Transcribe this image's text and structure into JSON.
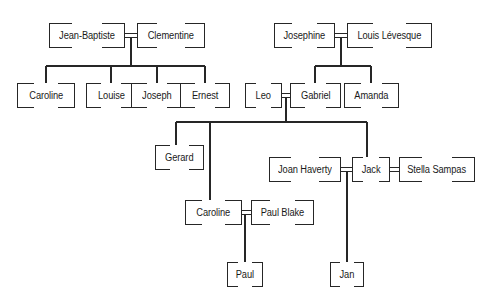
{
  "diagram": {
    "type": "family-tree",
    "background_color": "#ffffff",
    "line_color": "#262626",
    "text_color": "#1a1a1a"
  },
  "nodes": [
    {
      "id": "jean_baptiste",
      "label": "Jean-Baptiste",
      "x": 49,
      "y": 23,
      "w": 76,
      "h": 25,
      "generation": 1
    },
    {
      "id": "clementine",
      "label": "Clementine",
      "x": 137,
      "y": 23,
      "w": 68,
      "h": 25,
      "generation": 1
    },
    {
      "id": "josephine",
      "label": "Josephine",
      "x": 274,
      "y": 23,
      "w": 61,
      "h": 25,
      "generation": 1
    },
    {
      "id": "louis",
      "label": "Louis Lévesque",
      "x": 347,
      "y": 23,
      "w": 85,
      "h": 25,
      "generation": 1
    },
    {
      "id": "caroline1",
      "label": "Caroline",
      "x": 17,
      "y": 83,
      "w": 58,
      "h": 25,
      "generation": 2
    },
    {
      "id": "louise",
      "label": "Louise",
      "x": 86,
      "y": 83,
      "w": 50,
      "h": 25,
      "generation": 2
    },
    {
      "id": "joseph",
      "label": "Joseph",
      "x": 131,
      "y": 83,
      "w": 52,
      "h": 25,
      "generation": 2
    },
    {
      "id": "ernest",
      "label": "Ernest",
      "x": 180,
      "y": 83,
      "w": 50,
      "h": 25,
      "generation": 2
    },
    {
      "id": "leo",
      "label": "Leo",
      "x": 245,
      "y": 83,
      "w": 37,
      "h": 25,
      "generation": 2
    },
    {
      "id": "gabriel",
      "label": "Gabriel",
      "x": 290,
      "y": 83,
      "w": 51,
      "h": 25,
      "generation": 2
    },
    {
      "id": "amanda",
      "label": "Amanda",
      "x": 344,
      "y": 83,
      "w": 55,
      "h": 25,
      "generation": 2
    },
    {
      "id": "gerard",
      "label": "Gerard",
      "x": 155,
      "y": 145,
      "w": 49,
      "h": 25,
      "generation": 3
    },
    {
      "id": "joan_haverty",
      "label": "Joan Haverty",
      "x": 269,
      "y": 157,
      "w": 72,
      "h": 25,
      "generation": 3
    },
    {
      "id": "jack",
      "label": "Jack",
      "x": 352,
      "y": 157,
      "w": 38,
      "h": 25,
      "generation": 3
    },
    {
      "id": "stella",
      "label": "Stella Sampas",
      "x": 399,
      "y": 157,
      "w": 76,
      "h": 25,
      "generation": 3
    },
    {
      "id": "caroline2",
      "label": "Caroline",
      "x": 185,
      "y": 200,
      "w": 57,
      "h": 25,
      "generation": 3
    },
    {
      "id": "paul_blake",
      "label": "Paul Blake",
      "x": 251,
      "y": 200,
      "w": 63,
      "h": 25,
      "generation": 3
    },
    {
      "id": "paul",
      "label": "Paul",
      "x": 227,
      "y": 262,
      "w": 36,
      "h": 25,
      "generation": 4
    },
    {
      "id": "jan",
      "label": "Jan",
      "x": 330,
      "y": 262,
      "w": 34,
      "h": 25,
      "generation": 4
    }
  ],
  "marriages": [
    {
      "a": "jean_baptiste",
      "b": "clementine",
      "children": [
        "caroline1",
        "louise",
        "joseph",
        "ernest"
      ]
    },
    {
      "a": "josephine",
      "b": "louis",
      "children": [
        "gabriel",
        "amanda"
      ]
    },
    {
      "a": "leo",
      "b": "gabriel",
      "children": [
        "gerard",
        "caroline2",
        "jack"
      ]
    },
    {
      "a": "joan_haverty",
      "b": "jack",
      "children": [
        "jan"
      ]
    },
    {
      "a": "jack",
      "b": "stella",
      "children": []
    },
    {
      "a": "caroline2",
      "b": "paul_blake",
      "children": [
        "paul"
      ]
    }
  ],
  "segments": [
    {
      "name": "marriage-jeanbaptiste-clementine-top",
      "x1": 125,
      "y1": 33.5,
      "x2": 137,
      "y2": 33.5
    },
    {
      "name": "marriage-jeanbaptiste-clementine-bot",
      "x1": 125,
      "y1": 37.5,
      "x2": 137,
      "y2": 37.5
    },
    {
      "name": "drop-from-jb-clem",
      "x1": 131,
      "y1": 37.5,
      "x2": 131,
      "y2": 66
    },
    {
      "name": "sibling-bus-gen2-left",
      "x1": 46,
      "y1": 66,
      "x2": 205,
      "y2": 66
    },
    {
      "name": "drop-caroline1",
      "x1": 46,
      "y1": 66,
      "x2": 46,
      "y2": 83
    },
    {
      "name": "drop-louise",
      "x1": 111,
      "y1": 66,
      "x2": 111,
      "y2": 83
    },
    {
      "name": "drop-joseph",
      "x1": 157,
      "y1": 66,
      "x2": 157,
      "y2": 83
    },
    {
      "name": "drop-ernest",
      "x1": 205,
      "y1": 66,
      "x2": 205,
      "y2": 83
    },
    {
      "name": "marriage-josephine-louis-top",
      "x1": 335,
      "y1": 33.5,
      "x2": 347,
      "y2": 33.5
    },
    {
      "name": "marriage-josephine-louis-bot",
      "x1": 335,
      "y1": 37.5,
      "x2": 347,
      "y2": 37.5
    },
    {
      "name": "drop-from-jos-louis",
      "x1": 341,
      "y1": 37.5,
      "x2": 341,
      "y2": 66
    },
    {
      "name": "sibling-bus-gabriel-amanda",
      "x1": 315,
      "y1": 66,
      "x2": 371,
      "y2": 66
    },
    {
      "name": "drop-gabriel",
      "x1": 315,
      "y1": 66,
      "x2": 315,
      "y2": 83
    },
    {
      "name": "drop-amanda",
      "x1": 371,
      "y1": 66,
      "x2": 371,
      "y2": 83
    },
    {
      "name": "marriage-leo-gabriel-top",
      "x1": 282,
      "y1": 93.5,
      "x2": 290,
      "y2": 93.5
    },
    {
      "name": "marriage-leo-gabriel-bot",
      "x1": 282,
      "y1": 97.5,
      "x2": 290,
      "y2": 97.5
    },
    {
      "name": "drop-from-leo-gabriel",
      "x1": 286,
      "y1": 97.5,
      "x2": 286,
      "y2": 122
    },
    {
      "name": "sibling-bus-gen3",
      "x1": 176,
      "y1": 122,
      "x2": 367,
      "y2": 122
    },
    {
      "name": "drop-gerard",
      "x1": 176,
      "y1": 122,
      "x2": 176,
      "y2": 145
    },
    {
      "name": "drop-caroline2",
      "x1": 210,
      "y1": 122,
      "x2": 210,
      "y2": 200
    },
    {
      "name": "drop-jack",
      "x1": 367,
      "y1": 122,
      "x2": 367,
      "y2": 157
    },
    {
      "name": "marriage-joan-jack-top",
      "x1": 341,
      "y1": 167.5,
      "x2": 352,
      "y2": 167.5
    },
    {
      "name": "marriage-joan-jack-bot",
      "x1": 341,
      "y1": 171.5,
      "x2": 352,
      "y2": 171.5
    },
    {
      "name": "marriage-jack-stella-top",
      "x1": 390,
      "y1": 167.5,
      "x2": 399,
      "y2": 167.5
    },
    {
      "name": "marriage-jack-stella-bot",
      "x1": 390,
      "y1": 171.5,
      "x2": 399,
      "y2": 171.5
    },
    {
      "name": "drop-jan",
      "x1": 347,
      "y1": 171.5,
      "x2": 347,
      "y2": 262
    },
    {
      "name": "marriage-caroline2-paulblake-top",
      "x1": 242,
      "y1": 210.5,
      "x2": 251,
      "y2": 210.5
    },
    {
      "name": "marriage-caroline2-paulblake-bot",
      "x1": 242,
      "y1": 214.5,
      "x2": 251,
      "y2": 214.5
    },
    {
      "name": "drop-paul",
      "x1": 245,
      "y1": 214.5,
      "x2": 245,
      "y2": 262
    }
  ]
}
